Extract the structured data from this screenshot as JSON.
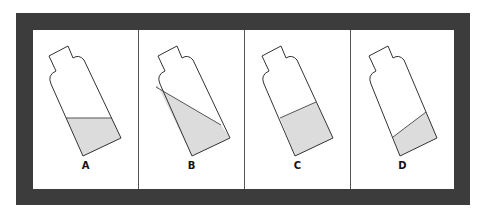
{
  "figure": {
    "colors": {
      "frame": "#3c3c3c",
      "background": "#ffffff",
      "liquid": "#dcdcdc",
      "outline": "#333333"
    },
    "panels": [
      {
        "label": "A",
        "liquid_surface": "horizontal"
      },
      {
        "label": "B",
        "liquid_surface": "tilted, parallel-to-diagonal"
      },
      {
        "label": "C",
        "liquid_surface": "perpendicular to bottle axis"
      },
      {
        "label": "D",
        "liquid_surface": "tilted, low"
      }
    ]
  }
}
